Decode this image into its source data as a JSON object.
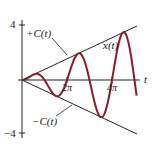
{
  "chart_data": {
    "type": "line",
    "title": "",
    "xlabel": "t",
    "ylabel": "",
    "xlim": [
      0,
      16
    ],
    "ylim": [
      -4,
      4
    ],
    "x_ticks": [
      "2π",
      "4π"
    ],
    "y_ticks": [
      "4",
      "-4"
    ],
    "grid": false,
    "series": [
      {
        "name": "x(t)",
        "formula": "x(t) = (t/4)·sin(t)",
        "color": "#8b1a2b"
      },
      {
        "name": "+C(t)",
        "formula": "C(t) = t/4",
        "color": "#222222"
      },
      {
        "name": "-C(t)",
        "formula": "-C(t) = -t/4",
        "color": "#222222"
      }
    ],
    "annotations": [
      "+C(t)",
      "x(t)",
      "-C(t)"
    ]
  },
  "labels": {
    "y_top": "4",
    "y_bottom": "−4",
    "x_axis": "t",
    "tick_2pi": "2π",
    "tick_4pi": "4π",
    "plus_c": "+C(t)",
    "minus_c": "−C(t)",
    "x_t": "x(t)"
  },
  "colors": {
    "curve": "#8b1a2b",
    "axes": "#222222"
  }
}
